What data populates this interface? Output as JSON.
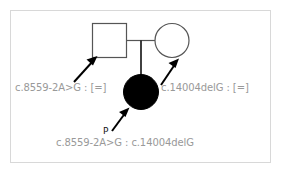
{
  "figure": {
    "kind": "pedigree-chart",
    "border_color": "#d8d8d8",
    "background": "#ffffff"
  },
  "symbols": {
    "father": {
      "shape": "square",
      "sex": "male",
      "affected": false,
      "fill": "#ffffff",
      "stroke": "#555555"
    },
    "mother": {
      "shape": "circle",
      "sex": "female",
      "affected": false,
      "fill": "#ffffff",
      "stroke": "#555555"
    },
    "proband": {
      "shape": "circle",
      "sex": "female",
      "affected": true,
      "fill": "#000000",
      "stroke": "#000000"
    }
  },
  "annotations": {
    "father_genotype": "c.8559-2A>G : [=]",
    "mother_genotype": "c.14004delG : [=]",
    "proband_genotype": "c.8559-2A>G : c.14004delG",
    "proband_marker": "P",
    "text_color": "#999999",
    "marker_color": "#111111"
  },
  "arrows": {
    "to_father": "arrow-icon",
    "to_mother": "arrow-icon",
    "to_proband": "arrow-icon"
  },
  "lines": {
    "partnership": "horizontal-mating-line",
    "descent": "vertical-descent-line"
  }
}
